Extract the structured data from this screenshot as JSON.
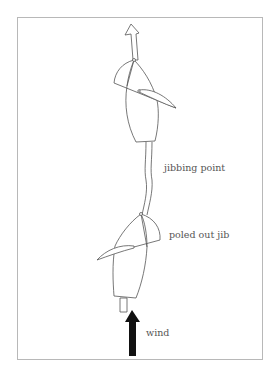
{
  "diagram": {
    "labels": {
      "jibbing_point": "jibbing point",
      "poled_out_jib": "poled out jib",
      "wind": "wind"
    },
    "colors": {
      "stroke": "#555555",
      "wind_arrow": "#111111",
      "frame": "#b8b8b8"
    }
  }
}
